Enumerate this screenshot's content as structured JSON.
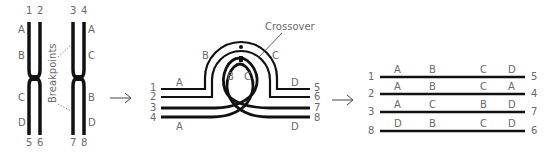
{
  "panel_left": {
    "top_numbers": [
      "1",
      "2",
      "3",
      "4"
    ],
    "bottom_numbers": [
      "5",
      "6",
      "7",
      "8"
    ],
    "left_chrom_labels": [
      "A",
      "B",
      "C",
      "D"
    ],
    "right_chrom_labels": [
      "A",
      "C",
      "B",
      "D"
    ],
    "annotation": "Breakpoints"
  },
  "panel_middle": {
    "left_numbers": [
      "1",
      "2",
      "3",
      "4"
    ],
    "right_numbers": [
      "5",
      "6",
      "7",
      "8"
    ],
    "labels": {
      "top_left_A": "A",
      "bottom_left_A": "A",
      "loop_B_outer": "B",
      "loop_C_outer": "C",
      "loop_B_inner": "B",
      "loop_C_inner": "C",
      "top_right_D": "D",
      "bottom_right_D": "D"
    },
    "annotation": "Crossover"
  },
  "panel_right": {
    "rows": [
      {
        "left": "1",
        "genes": [
          "A",
          "B",
          "C",
          "D"
        ],
        "right": "5"
      },
      {
        "left": "2",
        "genes": [
          "A",
          "B",
          "C",
          "A"
        ],
        "right": "4"
      },
      {
        "left": "3",
        "genes": [
          "A",
          "C",
          "B",
          "D"
        ],
        "right": "7"
      },
      {
        "left": "8",
        "genes": [
          "D",
          "B",
          "C",
          "D"
        ],
        "right": "6"
      }
    ]
  },
  "arrows": [
    "→",
    "→"
  ]
}
